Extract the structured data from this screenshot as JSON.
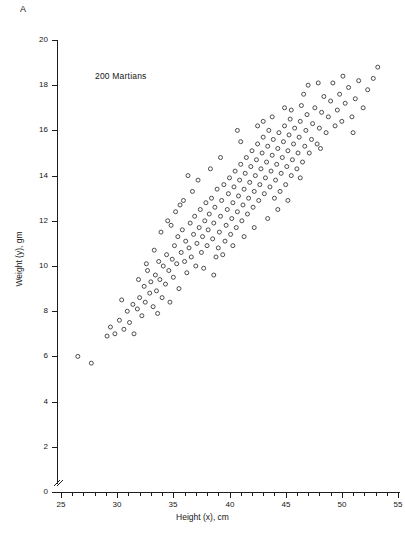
{
  "panel": {
    "label": "A"
  },
  "annotation": {
    "text": "200 Martians"
  },
  "chart_data": {
    "type": "scatter",
    "title": "",
    "subtitle": "",
    "xlabel": "Height (x), cm",
    "ylabel": "Weight (y), gm",
    "annotations": [
      "A",
      "200 Martians"
    ],
    "n_points": 200,
    "xlim": [
      25,
      55
    ],
    "ylim": [
      0,
      20
    ],
    "xticks": [
      25,
      30,
      35,
      40,
      45,
      50,
      55
    ],
    "xticklabels": [
      "25",
      "30",
      "35",
      "40",
      "45",
      "50",
      "55"
    ],
    "x_minor_tick_step": 1,
    "yticks": [
      0,
      2,
      4,
      6,
      8,
      10,
      12,
      14,
      16,
      18,
      20
    ],
    "yticklabels": [
      "0",
      "2",
      "4",
      "6",
      "8",
      "10",
      "12",
      "14",
      "16",
      "18",
      "20"
    ],
    "y_minor_ticks": false,
    "grid": false,
    "legend": false,
    "y_axis_break": true,
    "marker": "open-circle",
    "marker_size_px": 4,
    "marker_color": "#3a3a3a",
    "series": [
      {
        "name": "Martians",
        "points": [
          [
            26.5,
            6.0
          ],
          [
            27.7,
            5.7
          ],
          [
            29.4,
            7.3
          ],
          [
            29.8,
            7.0
          ],
          [
            30.2,
            7.6
          ],
          [
            30.6,
            7.2
          ],
          [
            30.9,
            8.0
          ],
          [
            31.1,
            7.5
          ],
          [
            31.4,
            8.3
          ],
          [
            31.5,
            7.0
          ],
          [
            31.8,
            8.1
          ],
          [
            32.0,
            8.6
          ],
          [
            32.2,
            7.8
          ],
          [
            32.4,
            9.1
          ],
          [
            32.5,
            8.4
          ],
          [
            32.7,
            9.8
          ],
          [
            32.9,
            8.8
          ],
          [
            33.0,
            9.3
          ],
          [
            33.2,
            8.2
          ],
          [
            33.4,
            9.6
          ],
          [
            33.5,
            8.9
          ],
          [
            33.7,
            10.2
          ],
          [
            33.8,
            9.4
          ],
          [
            34.0,
            8.6
          ],
          [
            34.1,
            10.0
          ],
          [
            34.3,
            9.2
          ],
          [
            34.4,
            10.5
          ],
          [
            34.6,
            9.8
          ],
          [
            34.7,
            8.4
          ],
          [
            34.9,
            10.3
          ],
          [
            35.0,
            9.5
          ],
          [
            35.1,
            10.9
          ],
          [
            35.3,
            10.1
          ],
          [
            35.4,
            11.3
          ],
          [
            35.5,
            9.0
          ],
          [
            35.7,
            10.6
          ],
          [
            35.8,
            11.6
          ],
          [
            36.0,
            10.2
          ],
          [
            36.1,
            11.1
          ],
          [
            36.2,
            9.7
          ],
          [
            36.4,
            10.8
          ],
          [
            36.5,
            11.9
          ],
          [
            36.6,
            10.4
          ],
          [
            36.8,
            11.4
          ],
          [
            36.9,
            12.2
          ],
          [
            37.0,
            10.0
          ],
          [
            37.1,
            11.0
          ],
          [
            37.3,
            11.7
          ],
          [
            37.4,
            12.5
          ],
          [
            37.5,
            10.6
          ],
          [
            37.6,
            11.3
          ],
          [
            37.8,
            12.0
          ],
          [
            37.9,
            12.8
          ],
          [
            38.0,
            10.9
          ],
          [
            38.1,
            11.6
          ],
          [
            38.2,
            12.3
          ],
          [
            38.4,
            13.0
          ],
          [
            38.5,
            11.2
          ],
          [
            38.6,
            11.9
          ],
          [
            38.7,
            12.6
          ],
          [
            38.9,
            13.4
          ],
          [
            39.0,
            10.8
          ],
          [
            39.1,
            11.5
          ],
          [
            39.2,
            12.2
          ],
          [
            39.3,
            12.9
          ],
          [
            39.5,
            13.6
          ],
          [
            39.6,
            11.1
          ],
          [
            39.7,
            11.8
          ],
          [
            39.8,
            12.5
          ],
          [
            39.9,
            13.2
          ],
          [
            40.0,
            13.9
          ],
          [
            40.1,
            11.4
          ],
          [
            40.2,
            12.1
          ],
          [
            40.3,
            12.8
          ],
          [
            40.4,
            13.5
          ],
          [
            40.5,
            14.2
          ],
          [
            40.6,
            11.7
          ],
          [
            40.7,
            12.4
          ],
          [
            40.8,
            13.1
          ],
          [
            40.9,
            13.8
          ],
          [
            41.0,
            14.5
          ],
          [
            41.1,
            12.0
          ],
          [
            41.2,
            12.7
          ],
          [
            41.3,
            13.4
          ],
          [
            41.4,
            14.1
          ],
          [
            41.5,
            14.8
          ],
          [
            41.6,
            12.3
          ],
          [
            41.7,
            13.0
          ],
          [
            41.8,
            13.7
          ],
          [
            41.9,
            14.4
          ],
          [
            42.0,
            15.1
          ],
          [
            42.1,
            12.6
          ],
          [
            42.2,
            13.3
          ],
          [
            42.3,
            14.0
          ],
          [
            42.4,
            14.7
          ],
          [
            42.5,
            15.4
          ],
          [
            42.6,
            12.9
          ],
          [
            42.7,
            13.6
          ],
          [
            42.8,
            14.3
          ],
          [
            42.9,
            15.0
          ],
          [
            43.0,
            15.7
          ],
          [
            43.1,
            13.2
          ],
          [
            43.2,
            13.9
          ],
          [
            43.3,
            14.6
          ],
          [
            43.4,
            15.3
          ],
          [
            43.5,
            16.0
          ],
          [
            43.6,
            13.5
          ],
          [
            43.7,
            14.2
          ],
          [
            43.8,
            14.9
          ],
          [
            43.9,
            15.6
          ],
          [
            44.0,
            13.0
          ],
          [
            44.1,
            13.8
          ],
          [
            44.2,
            14.5
          ],
          [
            44.3,
            15.2
          ],
          [
            44.4,
            15.9
          ],
          [
            44.5,
            13.3
          ],
          [
            44.6,
            14.1
          ],
          [
            44.7,
            14.8
          ],
          [
            44.8,
            15.5
          ],
          [
            44.9,
            16.2
          ],
          [
            45.0,
            13.6
          ],
          [
            45.1,
            14.4
          ],
          [
            45.2,
            15.1
          ],
          [
            45.3,
            15.8
          ],
          [
            45.4,
            16.5
          ],
          [
            45.5,
            14.0
          ],
          [
            45.6,
            14.7
          ],
          [
            45.7,
            15.4
          ],
          [
            45.8,
            16.1
          ],
          [
            46.0,
            14.3
          ],
          [
            46.1,
            15.0
          ],
          [
            46.2,
            15.7
          ],
          [
            46.3,
            16.4
          ],
          [
            46.4,
            17.1
          ],
          [
            46.5,
            14.6
          ],
          [
            46.7,
            15.3
          ],
          [
            46.8,
            16.0
          ],
          [
            46.9,
            16.7
          ],
          [
            47.0,
            18.0
          ],
          [
            47.1,
            15.0
          ],
          [
            47.3,
            15.6
          ],
          [
            47.4,
            16.3
          ],
          [
            47.6,
            17.0
          ],
          [
            47.8,
            15.4
          ],
          [
            48.0,
            16.1
          ],
          [
            48.2,
            16.8
          ],
          [
            48.4,
            17.5
          ],
          [
            48.6,
            15.9
          ],
          [
            48.8,
            16.6
          ],
          [
            49.0,
            17.3
          ],
          [
            49.2,
            18.1
          ],
          [
            49.4,
            16.2
          ],
          [
            49.6,
            16.9
          ],
          [
            49.8,
            17.6
          ],
          [
            50.0,
            16.4
          ],
          [
            50.3,
            17.2
          ],
          [
            50.6,
            17.9
          ],
          [
            50.9,
            16.6
          ],
          [
            51.2,
            17.4
          ],
          [
            51.5,
            18.2
          ],
          [
            51.9,
            17.0
          ],
          [
            52.3,
            17.8
          ],
          [
            52.8,
            18.3
          ],
          [
            53.2,
            18.8
          ],
          [
            33.9,
            11.5
          ],
          [
            34.5,
            12.0
          ],
          [
            35.2,
            12.4
          ],
          [
            35.9,
            12.9
          ],
          [
            36.7,
            13.3
          ],
          [
            37.2,
            13.8
          ],
          [
            38.3,
            14.3
          ],
          [
            38.8,
            10.4
          ],
          [
            39.4,
            10.5
          ],
          [
            40.3,
            10.9
          ],
          [
            41.3,
            11.3
          ],
          [
            42.2,
            11.7
          ],
          [
            43.4,
            12.1
          ],
          [
            44.3,
            12.5
          ],
          [
            45.2,
            12.9
          ],
          [
            31.9,
            9.4
          ],
          [
            32.6,
            10.1
          ],
          [
            33.3,
            10.7
          ],
          [
            30.4,
            8.5
          ],
          [
            29.1,
            6.9
          ],
          [
            36.3,
            14.0
          ],
          [
            37.7,
            9.9
          ],
          [
            43.0,
            16.4
          ],
          [
            44.9,
            17.0
          ],
          [
            46.6,
            17.6
          ],
          [
            47.9,
            18.1
          ],
          [
            50.1,
            18.4
          ],
          [
            51.0,
            15.9
          ],
          [
            48.1,
            15.2
          ],
          [
            45.5,
            16.9
          ],
          [
            42.5,
            16.2
          ],
          [
            41.0,
            15.5
          ],
          [
            39.2,
            14.8
          ],
          [
            34.8,
            11.8
          ],
          [
            33.6,
            7.9
          ],
          [
            35.6,
            12.7
          ],
          [
            38.6,
            9.6
          ],
          [
            40.7,
            16.0
          ],
          [
            43.8,
            16.6
          ],
          [
            46.3,
            13.9
          ]
        ]
      }
    ]
  },
  "axes": {
    "y": {
      "label": "Weight (y), gm",
      "ticks": [
        "20",
        "18",
        "16",
        "14",
        "12",
        "10",
        "8",
        "6",
        "4",
        "2",
        "0"
      ]
    },
    "x": {
      "label": "Height (x), cm",
      "ticks": [
        "25",
        "30",
        "35",
        "40",
        "45",
        "50",
        "55"
      ]
    }
  }
}
